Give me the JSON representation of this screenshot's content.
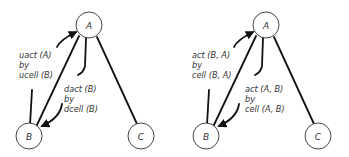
{
  "diagrams": [
    {
      "nodes": {
        "a": "A",
        "b": "B",
        "c": "C"
      },
      "up_annotation": {
        "line1": "uact (A)",
        "line2": "by",
        "line3": "ucell (B)"
      },
      "down_annotation": {
        "line1": "dact (B)",
        "line2": "by",
        "line3": "dcell (B)"
      }
    },
    {
      "nodes": {
        "a": "A",
        "b": "B",
        "c": "C"
      },
      "up_annotation": {
        "line1": "act (B, A)",
        "line2": "by",
        "line3": "cell (B, A)"
      },
      "down_annotation": {
        "line1": "act (A, B)",
        "line2": "by",
        "line3": "cell (A, B)"
      }
    }
  ]
}
